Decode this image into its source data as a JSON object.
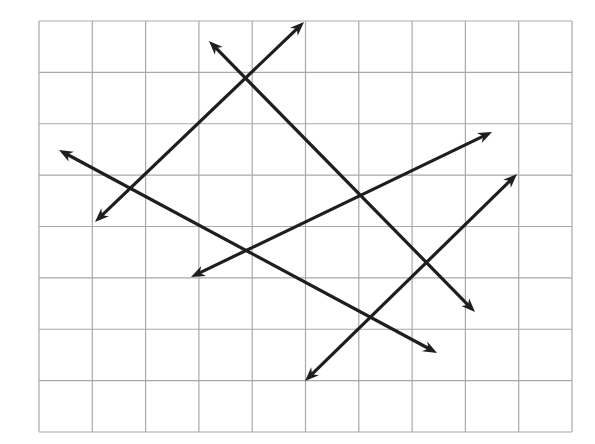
{
  "diagram": {
    "type": "grid-with-arrow-lines",
    "canvas": {
      "width": 595,
      "height": 444
    },
    "grid": {
      "left": 39,
      "top": 21,
      "right": 572,
      "bottom": 432,
      "columns": 10,
      "rows": 8,
      "line_color": "#a9a9a9",
      "line_width": 1.2,
      "background": "#ffffff"
    },
    "arrow_style": {
      "color": "#1e1e1e",
      "stroke_width": 3.2,
      "head_length": 14,
      "head_width": 11
    },
    "lines": [
      {
        "id": "line-1",
        "name": "ascending line from lower-left to top",
        "start": [
          95,
          222
        ],
        "end": [
          304,
          22
        ],
        "arrow_start": true,
        "arrow_end": true
      },
      {
        "id": "line-2",
        "name": "descending line from top to lower-right",
        "start": [
          209,
          41
        ],
        "end": [
          475,
          312
        ],
        "arrow_start": true,
        "arrow_end": true
      },
      {
        "id": "line-3",
        "name": "shallow descending line from left to lower-right",
        "start": [
          59,
          150
        ],
        "end": [
          437,
          353
        ],
        "arrow_start": true,
        "arrow_end": true
      },
      {
        "id": "line-4",
        "name": "shallow ascending line from center-left to right",
        "start": [
          191,
          277
        ],
        "end": [
          492,
          132
        ],
        "arrow_start": true,
        "arrow_end": true
      },
      {
        "id": "line-5",
        "name": "ascending line from bottom-center to right",
        "start": [
          305,
          381
        ],
        "end": [
          517,
          174
        ],
        "arrow_start": true,
        "arrow_end": true
      }
    ]
  }
}
